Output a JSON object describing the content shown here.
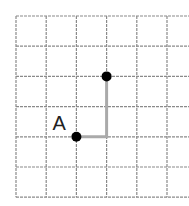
{
  "grid": {
    "origin_x": 16,
    "origin_y": 16,
    "cell_size": 30.2,
    "cols": 6,
    "rows": 6,
    "line_color": "#8a8a8a"
  },
  "points": [
    {
      "name": "A",
      "col": 2,
      "row": 4,
      "label": "A"
    },
    {
      "name": "end",
      "col": 3,
      "row": 2,
      "label": ""
    }
  ],
  "path": {
    "color": "#aaaaaa",
    "moves": [
      {
        "direction": "right",
        "units": 1
      },
      {
        "direction": "up",
        "units": 2
      }
    ]
  },
  "labels": {
    "point_a": "A"
  }
}
